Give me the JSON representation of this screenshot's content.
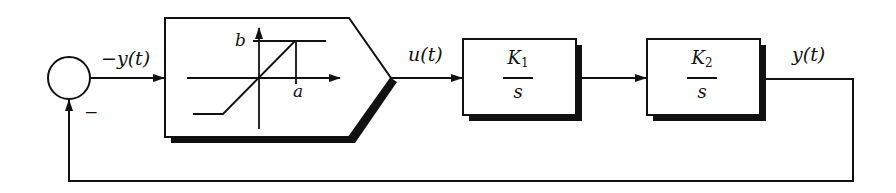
{
  "diagram": {
    "type": "feedback-block-diagram",
    "colors": {
      "line": "#111111",
      "shadow": "#111111",
      "background": "#ffffff"
    },
    "summing_junction": {
      "feedback_sign": "−"
    },
    "signals": {
      "error": "−y(t)",
      "control": "u(t)",
      "output": "y(t)"
    },
    "saturation_block": {
      "label_b": "b",
      "label_a": "a"
    },
    "blocks": [
      {
        "id": "K1",
        "numerator": "K",
        "subscript": "1",
        "denominator": "s"
      },
      {
        "id": "K2",
        "numerator": "K",
        "subscript": "2",
        "denominator": "s"
      }
    ]
  }
}
